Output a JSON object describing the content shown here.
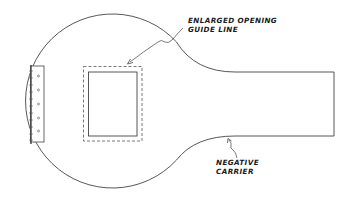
{
  "diagram": {
    "type": "technical-illustration",
    "line_color": "#444444",
    "background": "#ffffff"
  },
  "labels": {
    "guide_line": {
      "line1": "ENLARGED OPENING",
      "line2": "GUIDE LINE"
    },
    "carrier": {
      "line1": "NEGATIVE",
      "line2": "CARRIER"
    }
  },
  "parts": {
    "hinge_holes": 5
  }
}
